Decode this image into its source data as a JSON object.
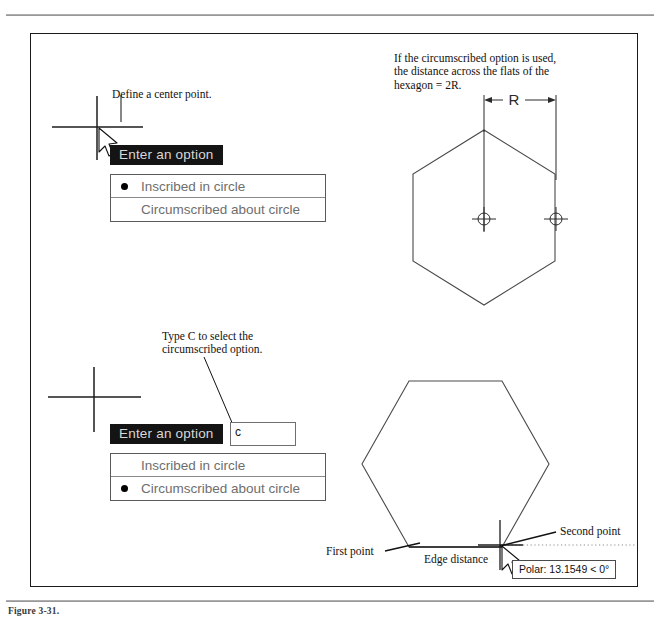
{
  "figure": {
    "caption": "Figure 3-31.",
    "border_color": "#1a1a1a"
  },
  "annotations": {
    "define_center": "Define a center point.",
    "circumscribed_note": "If the circumscribed option is used,\nthe distance across the flats of the\nhexagon = 2R.",
    "type_c_note": "Type C to select the\ncircumscribed option.",
    "first_point": "First point",
    "second_point": "Second point",
    "edge_distance": "Edge distance",
    "radius_label": "R"
  },
  "dynamic_input_top": {
    "prompt": "Enter an option",
    "options": [
      {
        "label": "Inscribed in circle",
        "selected": true
      },
      {
        "label": "Circumscribed about circle",
        "selected": false
      }
    ]
  },
  "dynamic_input_bottom": {
    "prompt": "Enter an option",
    "entry_value": "c",
    "options": [
      {
        "label": "Inscribed in circle",
        "selected": false
      },
      {
        "label": "Circumscribed about circle",
        "selected": true
      }
    ]
  },
  "tooltip": {
    "polar_readout": "Polar: 13.1549 < 0°"
  },
  "colors": {
    "prompt_background": "#141414",
    "prompt_text": "#d8d8d8",
    "menu_text": "#6e6e6e",
    "geometry_stroke": "#4a4a4a"
  }
}
